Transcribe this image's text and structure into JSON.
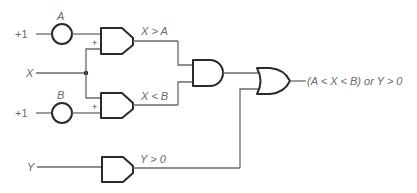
{
  "diagram": {
    "inputs": {
      "a_source": {
        "value": "+1",
        "label": "A"
      },
      "b_source": {
        "value": "+1",
        "label": "B"
      },
      "x": {
        "label": "X"
      },
      "y": {
        "label": "Y"
      }
    },
    "comparators": {
      "top": {
        "plus_label": "+",
        "output_label": "X > A"
      },
      "bottom": {
        "plus_label": "+",
        "output_label": "X < B"
      },
      "y": {
        "output_label": "Y > 0"
      }
    },
    "gates": {
      "and": {
        "type": "AND"
      },
      "or": {
        "type": "OR"
      }
    },
    "output": {
      "label": "(A < X < B) or Y > 0"
    },
    "colors": {
      "wire": "#6a6a6a",
      "gate_stroke": "#2a2a2a",
      "text": "#6a6a6a"
    }
  }
}
